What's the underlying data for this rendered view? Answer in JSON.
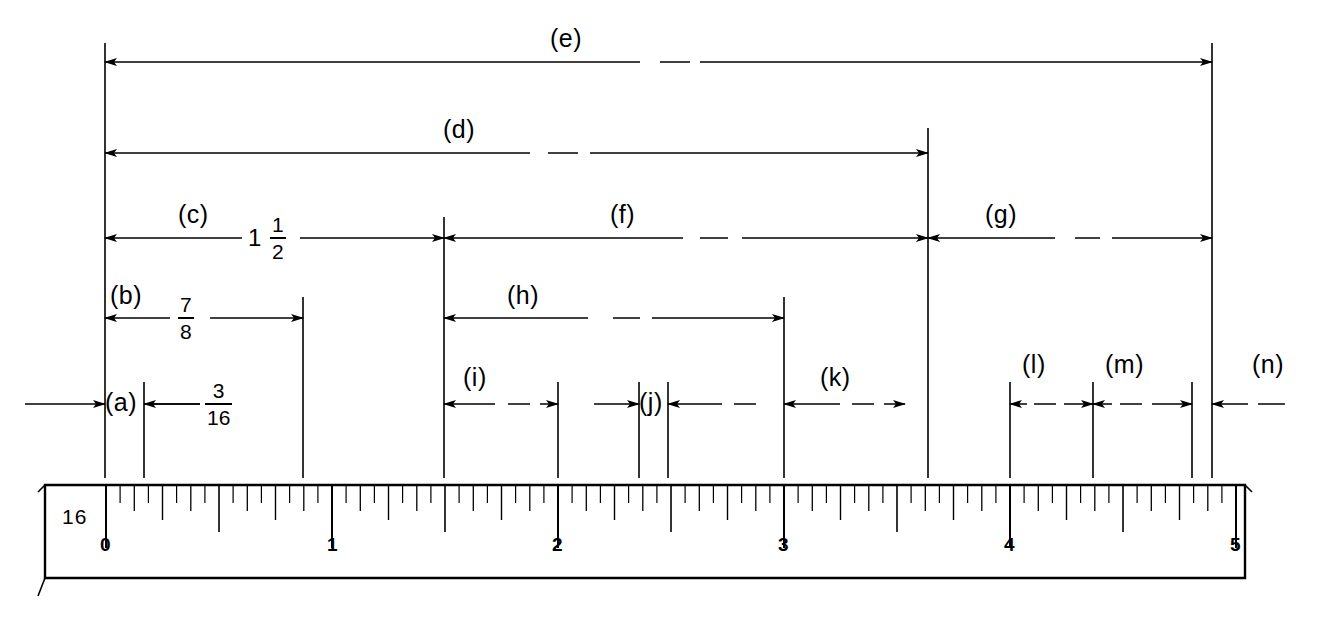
{
  "figure": {
    "type": "engineering-dimension-drawing",
    "stroke_color": "#000000",
    "background_color": "#ffffff"
  },
  "ruler": {
    "scale_label": "16",
    "tick_numbers": [
      "0",
      "1",
      "2",
      "3",
      "4",
      "5"
    ],
    "graduation": "sixteenths",
    "units": "inches",
    "length_inches": 5
  },
  "dimensions": [
    {
      "key": "e",
      "label": "(e)",
      "value": "",
      "row": 1
    },
    {
      "key": "d",
      "label": "(d)",
      "value": "",
      "row": 2
    },
    {
      "key": "c",
      "label": "(c)",
      "value_whole": "1",
      "value_num": "1",
      "value_den": "2",
      "row": 3
    },
    {
      "key": "f",
      "label": "(f)",
      "value": "",
      "row": 3
    },
    {
      "key": "g",
      "label": "(g)",
      "value": "",
      "row": 3
    },
    {
      "key": "b",
      "label": "(b)",
      "value_num": "7",
      "value_den": "8",
      "row": 4
    },
    {
      "key": "h",
      "label": "(h)",
      "value": "",
      "row": 4
    },
    {
      "key": "a",
      "label": "(a)",
      "value_num": "3",
      "value_den": "16",
      "row": 5
    },
    {
      "key": "i",
      "label": "(i)",
      "value": "",
      "row": 5
    },
    {
      "key": "j",
      "label": "(j)",
      "value": "",
      "row": 5
    },
    {
      "key": "k",
      "label": "(k)",
      "value": "",
      "row": 5
    },
    {
      "key": "l",
      "label": "(l)",
      "value": "",
      "row": 5
    },
    {
      "key": "m",
      "label": "(m)",
      "value": "",
      "row": 5
    },
    {
      "key": "n",
      "label": "(n)",
      "value": "",
      "row": 5
    }
  ],
  "labels": {
    "e": "(e)",
    "d": "(d)",
    "c": "(c)",
    "f": "(f)",
    "g": "(g)",
    "b": "(b)",
    "h": "(h)",
    "a": "(a)",
    "i": "(i)",
    "j": "(j)",
    "k": "(k)",
    "l": "(l)",
    "m": "(m)",
    "n": "(n)"
  },
  "fractions": {
    "c_whole": "1",
    "c_num": "1",
    "c_den": "2",
    "b_num": "7",
    "b_den": "8",
    "a_num": "3",
    "a_den": "16"
  },
  "ruler_marks": {
    "scale": "16",
    "n0": "0",
    "n1": "1",
    "n2": "2",
    "n3": "3",
    "n4": "4",
    "n5": "5"
  }
}
